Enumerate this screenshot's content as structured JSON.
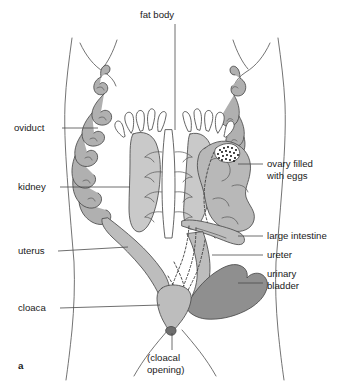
{
  "figure": {
    "marker": "a",
    "background_color": "#ffffff",
    "width": 349,
    "height": 390
  },
  "palette": {
    "outline": "#5a5a5a",
    "organ_stroke": "#4a4a4a",
    "leader_line": "#4a4a4a",
    "text": "#1a1a1a",
    "kidney_fill": "#c9c9c9",
    "fat_body_fill": "#ffffff",
    "oviduct_fill": "#b0b0b0",
    "ovary_fill": "#b8b8b8",
    "uterus_fill": "#bdbdbd",
    "large_intestine_fill": "#bdbdbd",
    "bladder_fill": "#8f8f8f",
    "egg_patch_fill": "#ffffff",
    "egg_dot": "#1a1a1a"
  },
  "labels": {
    "fat_body": "fat body",
    "oviduct": "oviduct",
    "kidney": "kidney",
    "uterus": "uterus",
    "cloaca": "cloaca",
    "ovary_line1": "ovary filled",
    "ovary_line2": "with eggs",
    "large_intestine": "large intestine",
    "ureter": "ureter",
    "urinary_line1": "urinary",
    "urinary_line2": "bladder",
    "cloacal_line1": "(cloacal",
    "cloacal_line2": "opening)"
  },
  "label_positions": {
    "fat_body": {
      "x": 140,
      "y": 18,
      "anchor": "start",
      "side": "top"
    },
    "oviduct": {
      "x": 14,
      "y": 131,
      "anchor": "start",
      "side": "left"
    },
    "kidney": {
      "x": 18,
      "y": 190,
      "anchor": "start",
      "side": "left"
    },
    "uterus": {
      "x": 18,
      "y": 254,
      "anchor": "start",
      "side": "left"
    },
    "cloaca": {
      "x": 18,
      "y": 311,
      "anchor": "start",
      "side": "left"
    },
    "ovary": {
      "x": 267,
      "y": 167,
      "anchor": "start",
      "side": "right"
    },
    "large_intestine": {
      "x": 267,
      "y": 239,
      "anchor": "start",
      "side": "right"
    },
    "ureter": {
      "x": 267,
      "y": 258,
      "anchor": "start",
      "side": "right"
    },
    "urinary_bladder": {
      "x": 267,
      "y": 277,
      "anchor": "start",
      "side": "right"
    },
    "cloacal_opening": {
      "x": 147,
      "y": 361,
      "anchor": "start",
      "side": "bottom"
    },
    "marker": {
      "x": 18,
      "y": 369,
      "anchor": "start",
      "side": "bottom-left"
    }
  },
  "organs": [
    {
      "name": "fat-body",
      "count": 2,
      "description": "paired finger-like lobes at top of kidneys",
      "fill": "#ffffff"
    },
    {
      "name": "kidney",
      "count": 2,
      "description": "paired elongate bean-shaped organs flanking midline",
      "fill": "#c9c9c9"
    },
    {
      "name": "oviduct",
      "count": 2,
      "description": "long tightly coiled tube on each flank",
      "fill": "#b0b0b0"
    },
    {
      "name": "ovary-filled-with-eggs",
      "count": 1,
      "description": "large lobed sac on right with stippled egg patch",
      "fill": "#b8b8b8"
    },
    {
      "name": "uterus",
      "count": 2,
      "description": "tapering tube leading from oviduct to cloaca",
      "fill": "#bdbdbd"
    },
    {
      "name": "large-intestine",
      "count": 1,
      "description": "broad tube descending to cloaca",
      "fill": "#bdbdbd"
    },
    {
      "name": "ureter",
      "count": 2,
      "description": "dashed ducts from kidney to cloaca",
      "fill": "none"
    },
    {
      "name": "urinary-bladder",
      "count": 1,
      "description": "dark bilobed sac at lower right",
      "fill": "#8f8f8f"
    },
    {
      "name": "cloaca",
      "count": 1,
      "description": "terminal chamber opening at body base",
      "fill": "#bdbdbd"
    }
  ]
}
